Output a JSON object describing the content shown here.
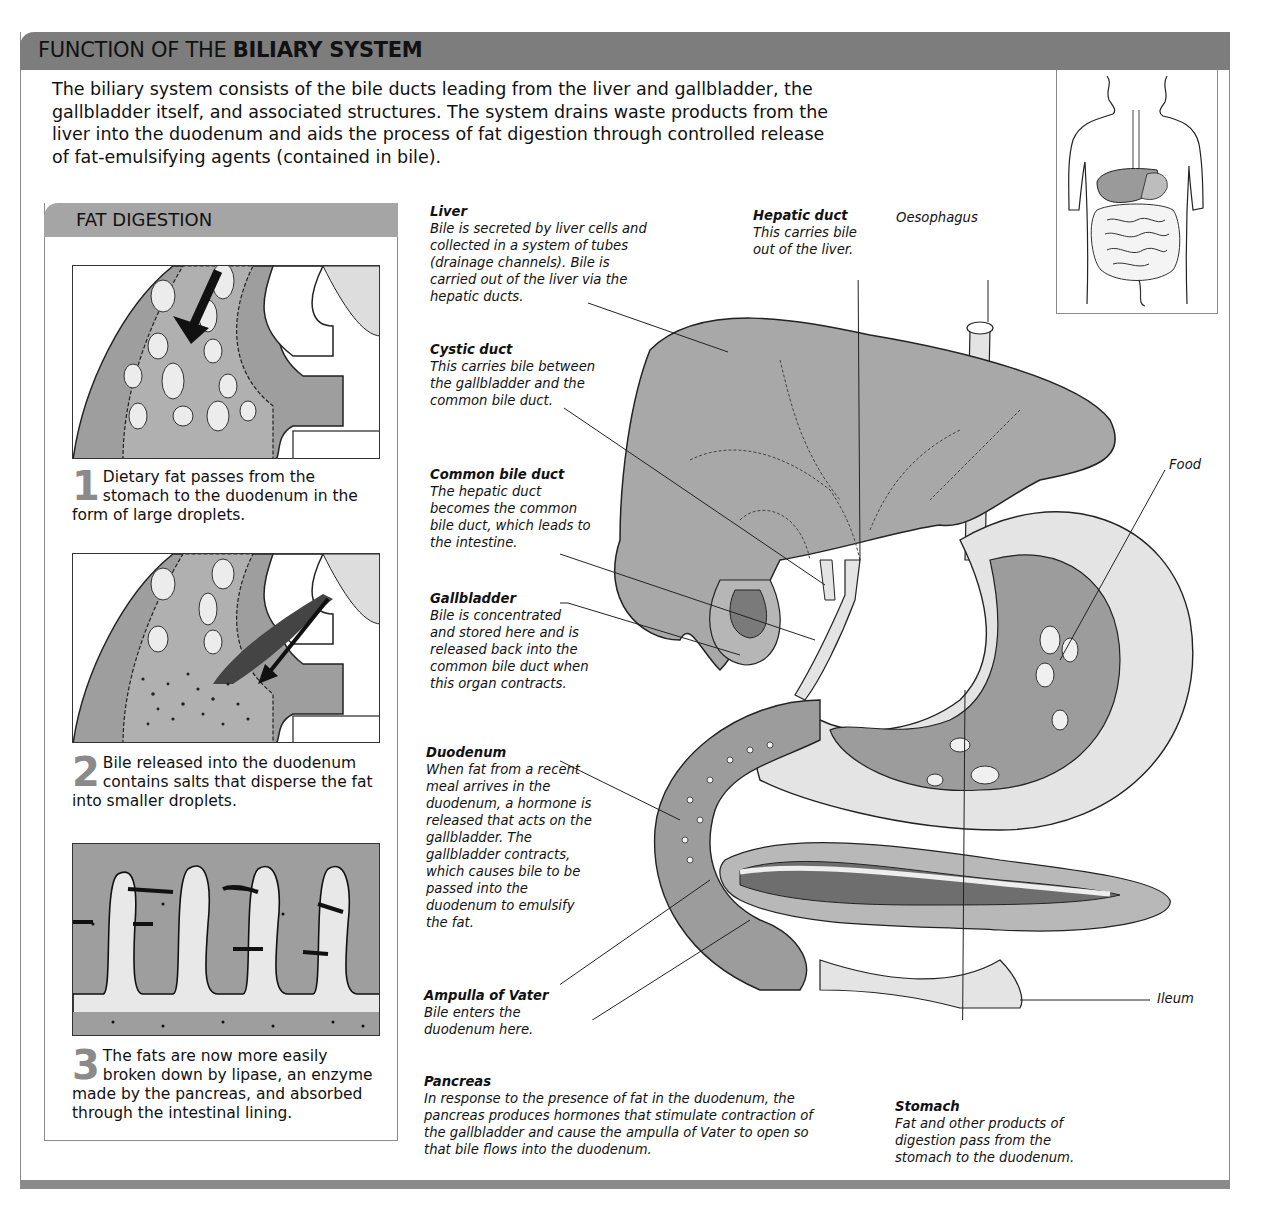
{
  "header": {
    "title_regular": "FUNCTION OF THE ",
    "title_bold": "BILIARY SYSTEM"
  },
  "intro": {
    "text": "The biliary system consists of the bile ducts leading from the liver and gallbladder, the gallbladder itself, and associated structures. The system drains waste products from the liver into the duodenum and aids the process of fat digestion through controlled release of fat-emulsifying agents (contained in bile)."
  },
  "fat_digestion": {
    "title": "FAT DIGESTION",
    "steps": [
      {
        "number": "1",
        "text": "Dietary fat passes from the stomach to the duodenum in the form of large droplets."
      },
      {
        "number": "2",
        "text": "Bile released into the duodenum contains salts that disperse the fat into smaller droplets."
      },
      {
        "number": "3",
        "text": "The fats are now more easily broken down by lipase, an enzyme made by the pancreas, and absorbed through the intestinal lining."
      }
    ]
  },
  "labels": {
    "liver": {
      "title": "Liver",
      "text": "Bile is secreted by liver cells and collected in a system of tubes (drainage channels). Bile is carried out of the liver via the hepatic ducts."
    },
    "cystic_duct": {
      "title": "Cystic duct",
      "text": "This carries bile between the gallbladder and the common bile duct."
    },
    "common_bile_duct": {
      "title": "Common bile duct",
      "text": "The hepatic duct becomes the common bile duct, which leads to the intestine."
    },
    "gallbladder": {
      "title": "Gallbladder",
      "text": "Bile is concentrated and stored here and is released back into the common bile duct when this organ contracts."
    },
    "duodenum": {
      "title": "Duodenum",
      "text": "When fat from a recent meal arrives in the duodenum, a hormone is released that acts on the gallbladder. The gallbladder contracts, which causes bile to be passed into the duodenum to emulsify the fat."
    },
    "ampulla": {
      "title": "Ampulla of Vater",
      "text": "Bile enters the duodenum here."
    },
    "pancreas": {
      "title": "Pancreas",
      "text": "In response to the presence of fat in the duodenum, the pancreas produces hormones that stimulate contraction of the gallbladder and cause the ampulla of Vater to open so that bile flows into the duodenum."
    },
    "hepatic_duct": {
      "title": "Hepatic duct",
      "text": "This carries bile out of the liver."
    },
    "oesophagus": {
      "title": "Oesophagus"
    },
    "food": {
      "title": "Food"
    },
    "ileum": {
      "title": "Ileum"
    },
    "stomach": {
      "title": "Stomach",
      "text": "Fat and other products of digestion pass from the stomach to the duodenum."
    }
  },
  "colors": {
    "header_bar": "#7d7d7d",
    "subheader_bar": "#a5a5a5",
    "organ_fill": "#a8a8a8",
    "organ_dark": "#6e6e6e",
    "light_fill": "#e4e4e4",
    "frame_line": "#8a8a8a"
  }
}
